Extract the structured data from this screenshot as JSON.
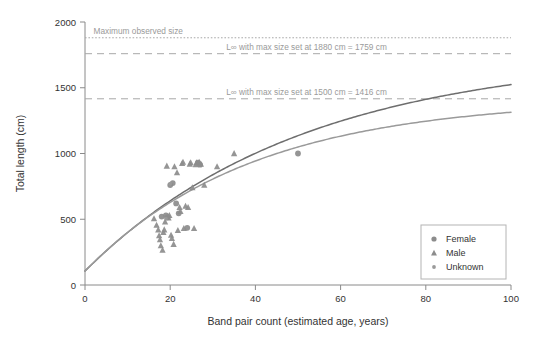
{
  "chart_data": {
    "type": "scatter",
    "title": "",
    "xlabel": "Band pair count (estimated age, years)",
    "ylabel": "Total length (cm)",
    "xlim": [
      0,
      100
    ],
    "ylim": [
      0,
      2000
    ],
    "xticks": [
      0,
      20,
      40,
      60,
      80,
      100
    ],
    "yticks": [
      0,
      500,
      1000,
      1500,
      2000
    ],
    "xtick_labels": [
      "0",
      "20",
      "40",
      "60",
      "80",
      "100"
    ],
    "ytick_labels": [
      "0",
      "500",
      "1000",
      "1500",
      "2000"
    ],
    "grid": false,
    "legend_position": "lower right",
    "legend": [
      {
        "name": "Female",
        "marker": "circle",
        "color": "#8c8c8c"
      },
      {
        "name": "Male",
        "marker": "triangle",
        "color": "#8c8c8c"
      },
      {
        "name": "Unknown",
        "marker": "small-circle",
        "color": "#9a9a9a"
      }
    ],
    "reference_lines": [
      {
        "name": "maximum-observed-size",
        "label": "Maximum observed size",
        "y": 1880,
        "style": "dotted",
        "color": "#a8a8a8",
        "label_anchor": "start",
        "label_x": 2
      },
      {
        "name": "linf-1880",
        "label": "L∞ with max size set at 1880 cm = 1759 cm",
        "y": 1759,
        "style": "dashed",
        "color": "#a8a8a8",
        "label_anchor": "middle",
        "label_x": 52
      },
      {
        "name": "linf-1500",
        "label": "L∞ with max size set at 1500 cm = 1416 cm",
        "y": 1416,
        "style": "dashed",
        "color": "#a8a8a8",
        "label_anchor": "middle",
        "label_x": 52
      }
    ],
    "curves": [
      {
        "name": "von-bertalanffy-1880",
        "color": "#6e6e6e",
        "width": 1.5,
        "linf": 1759,
        "k": 0.0195,
        "t0": -3.2,
        "points": [
          [
            0,
            105
          ],
          [
            2,
            170
          ],
          [
            4,
            232
          ],
          [
            6,
            292
          ],
          [
            8,
            350
          ],
          [
            10,
            405
          ],
          [
            12,
            458
          ],
          [
            14,
            509
          ],
          [
            16,
            558
          ],
          [
            18,
            605
          ],
          [
            20,
            650
          ],
          [
            24,
            735
          ],
          [
            28,
            813
          ],
          [
            32,
            885
          ],
          [
            36,
            952
          ],
          [
            40,
            1013
          ],
          [
            45,
            1083
          ],
          [
            50,
            1146
          ],
          [
            55,
            1203
          ],
          [
            60,
            1255
          ],
          [
            65,
            1302
          ],
          [
            70,
            1345
          ],
          [
            75,
            1384
          ],
          [
            80,
            1419
          ],
          [
            85,
            1451
          ],
          [
            90,
            1480
          ],
          [
            95,
            1506
          ],
          [
            100,
            1450
          ]
        ]
      },
      {
        "name": "von-bertalanffy-1500",
        "color": "#9a9a9a",
        "width": 1.5,
        "linf": 1416,
        "k": 0.0255,
        "t0": -3.0,
        "points": [
          [
            0,
            105
          ],
          [
            2,
            170
          ],
          [
            4,
            233
          ],
          [
            6,
            293
          ],
          [
            8,
            351
          ],
          [
            10,
            406
          ],
          [
            12,
            459
          ],
          [
            14,
            509
          ],
          [
            16,
            557
          ],
          [
            18,
            603
          ],
          [
            20,
            647
          ],
          [
            24,
            729
          ],
          [
            28,
            803
          ],
          [
            32,
            871
          ],
          [
            36,
            932
          ],
          [
            40,
            987
          ],
          [
            45,
            1049
          ],
          [
            50,
            1103
          ],
          [
            55,
            1151
          ],
          [
            60,
            1193
          ],
          [
            65,
            1230
          ],
          [
            70,
            1263
          ],
          [
            75,
            1291
          ],
          [
            80,
            1316
          ],
          [
            85,
            1337
          ],
          [
            90,
            1356
          ],
          [
            95,
            1372
          ],
          [
            100,
            1280
          ]
        ]
      }
    ],
    "series": [
      {
        "name": "Female",
        "marker": "circle",
        "color": "#8c8c8c",
        "points": [
          [
            18.0,
            520
          ],
          [
            19.0,
            530
          ],
          [
            19.4,
            515
          ],
          [
            20.0,
            760
          ],
          [
            20.6,
            775
          ],
          [
            21.4,
            620
          ],
          [
            22.0,
            545
          ],
          [
            24.0,
            435
          ],
          [
            26.5,
            930
          ],
          [
            27.0,
            915
          ],
          [
            50.0,
            1000
          ]
        ]
      },
      {
        "name": "Male",
        "marker": "triangle",
        "color": "#8c8c8c",
        "points": [
          [
            16.2,
            505
          ],
          [
            16.8,
            455
          ],
          [
            17.2,
            420
          ],
          [
            17.4,
            375
          ],
          [
            17.6,
            345
          ],
          [
            17.8,
            300
          ],
          [
            18.2,
            265
          ],
          [
            18.4,
            400
          ],
          [
            18.6,
            420
          ],
          [
            18.8,
            480
          ],
          [
            19.2,
            905
          ],
          [
            19.6,
            510
          ],
          [
            19.8,
            530
          ],
          [
            20.2,
            380
          ],
          [
            20.4,
            355
          ],
          [
            20.8,
            310
          ],
          [
            21.0,
            900
          ],
          [
            21.6,
            855
          ],
          [
            21.8,
            415
          ],
          [
            22.2,
            590
          ],
          [
            22.4,
            560
          ],
          [
            22.8,
            925
          ],
          [
            23.0,
            935
          ],
          [
            23.2,
            430
          ],
          [
            23.6,
            600
          ],
          [
            24.2,
            590
          ],
          [
            24.6,
            920
          ],
          [
            24.8,
            930
          ],
          [
            25.2,
            740
          ],
          [
            25.6,
            430
          ],
          [
            26.0,
            915
          ],
          [
            26.2,
            930
          ],
          [
            26.8,
            935
          ],
          [
            27.2,
            920
          ],
          [
            28.0,
            760
          ],
          [
            31.0,
            900
          ],
          [
            35.0,
            1000
          ]
        ]
      },
      {
        "name": "Unknown",
        "marker": "small-circle",
        "color": "#9a9a9a",
        "points": [
          [
            20.0,
            770
          ],
          [
            19.0,
            505
          ]
        ]
      }
    ]
  }
}
